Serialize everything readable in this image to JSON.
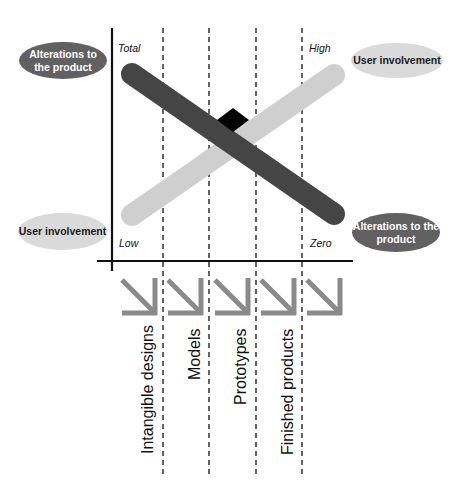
{
  "diagram": {
    "type": "crossing-trend-diagram",
    "colors": {
      "alterations_bar": "#454545",
      "user_involvement_bar": "#cfcfcf",
      "intersection": "#000000",
      "dark_ellipse": "#616161",
      "light_ellipse": "#dadada",
      "arrow": "#8a8a8a",
      "axis": "#111111"
    },
    "left_labels": {
      "top": "Alterations to the product",
      "top_line1": "Alterations to",
      "top_line2": "the product",
      "bottom": "User involvement"
    },
    "right_labels": {
      "top": "User involvement",
      "bottom": "Alterations to the product",
      "bottom_line1": "Alterations to the",
      "bottom_line2": "product"
    },
    "scale_labels": {
      "top_left": "Total",
      "bottom_left": "Low",
      "top_right": "High",
      "bottom_right": "Zero"
    },
    "stages": [
      {
        "label": "Intangible designs",
        "arrow": "down-right-arrow"
      },
      {
        "label": "Models",
        "arrow": "down-right-arrow"
      },
      {
        "label": "Prototypes",
        "arrow": "down-right-arrow"
      },
      {
        "label": "Finished products",
        "arrow": "down-right-arrow"
      },
      {
        "label": "",
        "arrow": "down-right-arrow"
      }
    ],
    "trends": [
      {
        "name": "Alterations to the product",
        "from": "Total",
        "to": "Zero",
        "direction": "decreasing"
      },
      {
        "name": "User involvement",
        "from": "Low",
        "to": "High",
        "direction": "increasing"
      }
    ]
  }
}
